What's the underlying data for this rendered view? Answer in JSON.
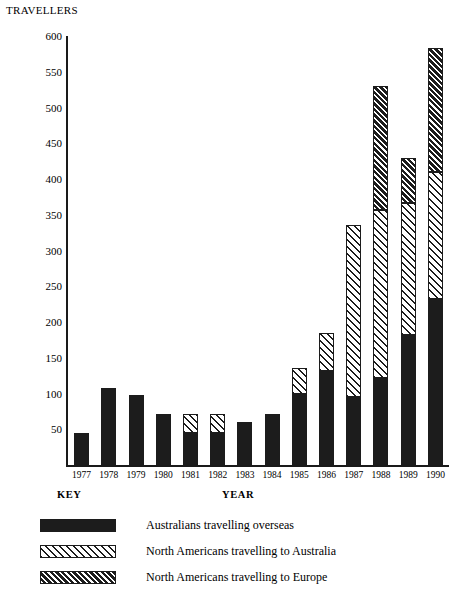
{
  "axis_title": "TRAVELLERS",
  "key_heading": "KEY",
  "year_heading": "YEAR",
  "chart_data": {
    "type": "bar",
    "subtype": "stacked",
    "title": "",
    "xlabel": "YEAR",
    "ylabel": "TRAVELLERS",
    "ylim": [
      0,
      600
    ],
    "ytick_step": 50,
    "yticks": [
      0,
      50,
      100,
      150,
      200,
      250,
      300,
      350,
      400,
      450,
      500,
      550,
      600
    ],
    "ytick_labels": [
      "",
      "50",
      "100",
      "150",
      "200",
      "250",
      "300",
      "350",
      "400",
      "450",
      "500",
      "550",
      "600"
    ],
    "grid": false,
    "legend_position": "below",
    "categories": [
      "1977",
      "1978",
      "1979",
      "1980",
      "1981",
      "1982",
      "1983",
      "1984",
      "1985",
      "1986",
      "1987",
      "1988",
      "1989",
      "1990"
    ],
    "series": [
      {
        "name": "Australians travelling overseas",
        "fill": "solid",
        "color": "#1c1c1c",
        "values": [
          45,
          108,
          98,
          72,
          45,
          45,
          60,
          72,
          100,
          132,
          95,
          122,
          182,
          232
        ]
      },
      {
        "name": "North Americans travelling to Australia",
        "fill": "hatch-light",
        "color": "#1c1c1c",
        "values": [
          0,
          0,
          0,
          0,
          27,
          27,
          0,
          0,
          35,
          53,
          240,
          235,
          185,
          178
        ]
      },
      {
        "name": "North Americans travelling to Europe",
        "fill": "hatch-dark",
        "color": "#1c1c1c",
        "values": [
          0,
          0,
          0,
          0,
          0,
          0,
          0,
          0,
          0,
          0,
          0,
          173,
          63,
          173
        ]
      }
    ],
    "totals": [
      45,
      108,
      98,
      72,
      72,
      72,
      60,
      72,
      135,
      185,
      335,
      530,
      430,
      583
    ]
  },
  "legend": [
    {
      "label": "Australians travelling overseas",
      "fill": "solid"
    },
    {
      "label": "North Americans travelling to Australia",
      "fill": "hatch-light"
    },
    {
      "label": "North Americans travelling to Europe",
      "fill": "hatch-dark"
    }
  ]
}
